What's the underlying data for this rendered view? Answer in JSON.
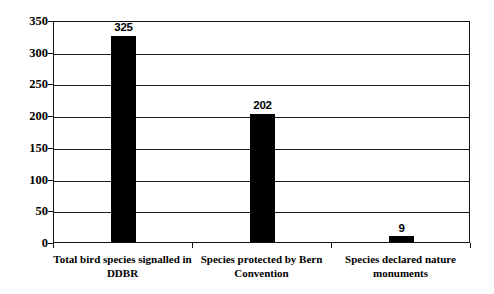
{
  "chart_data": {
    "type": "bar",
    "title": "",
    "subtitle": "",
    "xlabel": "",
    "ylabel": "",
    "categories": [
      "Total bird species signalled in DDBR",
      "Species protected by Bern Convention",
      "Species declared nature monuments"
    ],
    "values": [
      325,
      202,
      9
    ],
    "data_labels": [
      "325",
      "202",
      "9"
    ],
    "ylim": [
      0,
      350
    ],
    "ytick_step": 50,
    "ytick_labels": [
      "350",
      "300",
      "250",
      "200",
      "150",
      "100",
      "50",
      "0"
    ],
    "ytick_values": [
      350,
      300,
      250,
      200,
      150,
      100,
      50,
      0
    ],
    "grid": true,
    "grid_axis": "y",
    "legend": false,
    "legend_position": "none",
    "bar_color": "#000000",
    "frame_color": "#111111",
    "background": "#ffffff",
    "series": [
      {
        "name": "Bird species in DDBR",
        "values": [
          325,
          202,
          9
        ]
      }
    ]
  },
  "axes": {
    "y_label_1": "350",
    "y_label_2": "300",
    "y_label_3": "250",
    "y_label_4": "200",
    "y_label_5": "150",
    "y_label_6": "100",
    "y_label_7": "50",
    "y_label_8": "0"
  }
}
